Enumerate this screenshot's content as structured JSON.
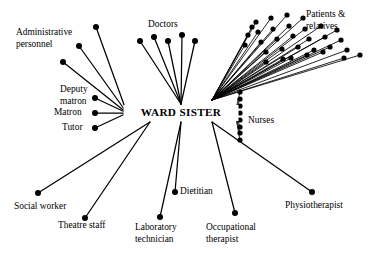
{
  "diagram": {
    "title": "WARD SISTER",
    "type": "role-set-radial-network",
    "canvas": {
      "width": 384,
      "height": 254,
      "background": "#ffffff"
    },
    "colors": {
      "ink": "#000000",
      "paper": "#ffffff"
    },
    "hub": {
      "label": "WARD SISTER",
      "label_x": 181,
      "label_y": 113,
      "left_anchor_x": 127,
      "right_anchor_x": 234,
      "anchor_y": 113
    },
    "groups": [
      {
        "name": "administrative-personnel",
        "label": "Administrative\npersonnel",
        "label_lines": [
          "Administrative",
          "personnel"
        ],
        "label_x": 16,
        "label_y": 33,
        "label_anchor": "start",
        "count": 3,
        "dots": [
          {
            "x": 96,
            "y": 27
          },
          {
            "x": 79,
            "y": 46
          },
          {
            "x": 63,
            "y": 62
          }
        ],
        "hub_side": "left"
      },
      {
        "name": "doctors",
        "label": "Doctors",
        "label_lines": [
          "Doctors"
        ],
        "label_x": 148,
        "label_y": 25,
        "label_anchor": "start",
        "count": 5,
        "dots": [
          {
            "x": 140,
            "y": 41
          },
          {
            "x": 154,
            "y": 37
          },
          {
            "x": 168,
            "y": 41
          },
          {
            "x": 182,
            "y": 35
          },
          {
            "x": 195,
            "y": 41
          }
        ],
        "hub_side": "top"
      },
      {
        "name": "patients-and-relatives",
        "label": "Patients &\nrelatives",
        "label_lines": [
          "Patients &",
          "relatives"
        ],
        "label_x": 306,
        "label_y": 15,
        "label_anchor": "start",
        "count": 24,
        "dots": [
          {
            "x": 256,
            "y": 22
          },
          {
            "x": 271,
            "y": 18
          },
          {
            "x": 287,
            "y": 15
          },
          {
            "x": 303,
            "y": 18
          },
          {
            "x": 258,
            "y": 32
          },
          {
            "x": 273,
            "y": 29
          },
          {
            "x": 289,
            "y": 26
          },
          {
            "x": 305,
            "y": 29
          },
          {
            "x": 321,
            "y": 26
          },
          {
            "x": 337,
            "y": 30
          },
          {
            "x": 261,
            "y": 42
          },
          {
            "x": 277,
            "y": 39
          },
          {
            "x": 293,
            "y": 36
          },
          {
            "x": 309,
            "y": 39
          },
          {
            "x": 325,
            "y": 37
          },
          {
            "x": 341,
            "y": 40
          },
          {
            "x": 266,
            "y": 52
          },
          {
            "x": 282,
            "y": 49
          },
          {
            "x": 298,
            "y": 47
          },
          {
            "x": 314,
            "y": 50
          },
          {
            "x": 330,
            "y": 47
          },
          {
            "x": 347,
            "y": 50
          },
          {
            "x": 291,
            "y": 58
          },
          {
            "x": 307,
            "y": 55
          },
          {
            "x": 323,
            "y": 52
          },
          {
            "x": 344,
            "y": 58
          },
          {
            "x": 360,
            "y": 55
          },
          {
            "x": 266,
            "y": 62
          },
          {
            "x": 283,
            "y": 59
          },
          {
            "x": 248,
            "y": 35
          },
          {
            "x": 252,
            "y": 27
          },
          {
            "x": 245,
            "y": 45
          }
        ],
        "hub_side": "right-upper"
      },
      {
        "name": "nurses",
        "label": "Nurses",
        "label_lines": [
          "Nurses"
        ],
        "label_x": 248,
        "label_y": 121,
        "label_anchor": "start",
        "count": 8,
        "dots": [
          {
            "x": 240,
            "y": 92
          },
          {
            "x": 240,
            "y": 99
          },
          {
            "x": 240,
            "y": 106
          },
          {
            "x": 240,
            "y": 113
          },
          {
            "x": 240,
            "y": 120
          },
          {
            "x": 240,
            "y": 127
          },
          {
            "x": 240,
            "y": 133
          },
          {
            "x": 240,
            "y": 140
          }
        ],
        "hub_side": "right"
      },
      {
        "name": "deputy-matron",
        "label": "Deputy\nmatron",
        "label_lines": [
          "Deputy",
          "matron"
        ],
        "label_x": 60,
        "label_y": 90,
        "label_anchor": "start",
        "count": 1,
        "dots": [
          {
            "x": 95,
            "y": 98
          }
        ],
        "hub_side": "left"
      },
      {
        "name": "matron",
        "label": "Matron",
        "label_lines": [
          "Matron"
        ],
        "label_x": 54,
        "label_y": 113,
        "label_anchor": "start",
        "count": 1,
        "dots": [
          {
            "x": 95,
            "y": 113
          }
        ],
        "hub_side": "left"
      },
      {
        "name": "tutor",
        "label": "Tutor",
        "label_lines": [
          "Tutor"
        ],
        "label_x": 62,
        "label_y": 128,
        "label_anchor": "start",
        "count": 1,
        "dots": [
          {
            "x": 95,
            "y": 128
          }
        ],
        "hub_side": "left"
      },
      {
        "name": "social-worker",
        "label": "Social  worker",
        "label_lines": [
          "Social  worker"
        ],
        "label_x": 14,
        "label_y": 207,
        "label_anchor": "start",
        "count": 1,
        "dots": [
          {
            "x": 38,
            "y": 193
          }
        ],
        "hub_side": "bottom-left"
      },
      {
        "name": "theatre-staff",
        "label": "Theatre staff",
        "label_lines": [
          "Theatre staff"
        ],
        "label_x": 58,
        "label_y": 226,
        "label_anchor": "start",
        "count": 1,
        "dots": [
          {
            "x": 85,
            "y": 218
          }
        ],
        "hub_side": "bottom-left"
      },
      {
        "name": "laboratory-technician",
        "label": "Laboratory\ntechnician",
        "label_lines": [
          "Laboratory",
          "technician"
        ],
        "label_x": 135,
        "label_y": 228,
        "label_anchor": "start",
        "count": 1,
        "dots": [
          {
            "x": 160,
            "y": 217
          }
        ],
        "hub_side": "bottom"
      },
      {
        "name": "dietitian",
        "label": "Dietitian",
        "label_lines": [
          "Dietitian"
        ],
        "label_x": 180,
        "label_y": 192,
        "label_anchor": "start",
        "count": 1,
        "dots": [
          {
            "x": 175,
            "y": 192
          }
        ],
        "hub_side": "bottom"
      },
      {
        "name": "occupational-therapist",
        "label": "Occupational\ntherapist",
        "label_lines": [
          "Occupational",
          "therapist"
        ],
        "label_x": 206,
        "label_y": 228,
        "label_anchor": "start",
        "count": 1,
        "dots": [
          {
            "x": 235,
            "y": 213
          }
        ],
        "hub_side": "bottom-right"
      },
      {
        "name": "physiotherapist",
        "label": "Physiotherapist",
        "label_lines": [
          "Physiotherapist"
        ],
        "label_x": 285,
        "label_y": 206,
        "label_anchor": "start",
        "count": 1,
        "dots": [
          {
            "x": 312,
            "y": 192
          }
        ],
        "hub_side": "bottom-right"
      }
    ]
  }
}
